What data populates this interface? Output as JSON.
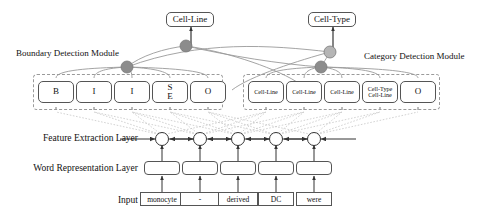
{
  "figure": {
    "title_top_left_output": "Cell-Line",
    "title_top_right_output": "Cell-Type"
  },
  "outputs": [
    {
      "id": "output-cell-line",
      "label": "Cell-Line",
      "x": 166,
      "y": 10,
      "w": 50,
      "h": 15
    },
    {
      "id": "output-cell-type",
      "label": "Cell-Type",
      "x": 308,
      "y": 10,
      "w": 50,
      "h": 15
    }
  ],
  "module_labels": {
    "boundary": "Boundary Detection Module",
    "category": "Category Detection Module"
  },
  "row_labels": {
    "feature_extraction": "Feature Extraction Layer",
    "word_representation": "Word Representation Layer",
    "input": "Input"
  },
  "boundary_module": {
    "name": "Boundary Detection Module",
    "tags": [
      {
        "label": "B",
        "lines": [
          "B"
        ]
      },
      {
        "label": "I",
        "lines": [
          "I"
        ]
      },
      {
        "label": "I",
        "lines": [
          "I"
        ]
      },
      {
        "label": "S E",
        "lines": [
          "S",
          "E"
        ]
      },
      {
        "label": "O",
        "lines": [
          "O"
        ]
      }
    ]
  },
  "category_module": {
    "name": "Category Detection Module",
    "tags": [
      {
        "label": "Cell-Line",
        "lines": [
          "Cell-Line"
        ]
      },
      {
        "label": "Cell-Line",
        "lines": [
          "Cell-Line"
        ]
      },
      {
        "label": "Cell-Line",
        "lines": [
          "Cell-Line"
        ]
      },
      {
        "label": "Cell-Type Cell-Line",
        "lines": [
          "Cell-Type",
          "Cell-Line"
        ]
      },
      {
        "label": "O",
        "lines": [
          "O"
        ]
      }
    ]
  },
  "input_tokens": [
    {
      "text": "monocyte"
    },
    {
      "text": "-"
    },
    {
      "text": "derived"
    },
    {
      "text": "DC"
    },
    {
      "text": "were"
    }
  ],
  "aggregation_nodes": [
    {
      "id": "boundary-node-left",
      "x": 127,
      "y": 67,
      "fill": "#8c8c8c"
    },
    {
      "id": "boundary-node-top",
      "x": 186,
      "y": 46,
      "fill": "#8c8c8c"
    },
    {
      "id": "category-node-top",
      "x": 330,
      "y": 52,
      "fill": "#b5b5b5"
    },
    {
      "id": "category-node-right",
      "x": 321,
      "y": 67,
      "fill": "#8c8c8c"
    }
  ],
  "colors": {
    "node_dark": "#8c8c8c",
    "node_light": "#b5b5b5",
    "stroke": "#555555",
    "dashed": "#9a9a9a",
    "crosslink": "#bdbdbd",
    "background": "#ffffff"
  },
  "layout": {
    "token_x_centers": [
      162,
      200,
      238,
      276,
      314
    ],
    "feature_layer_y": 139,
    "word_layer_y": 168,
    "input_layer_y": 199
  }
}
